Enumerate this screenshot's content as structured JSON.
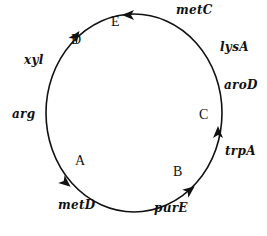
{
  "diagram": {
    "type": "circular-chromosome-map",
    "circle": {
      "cx": 134,
      "cy": 113,
      "rx": 88,
      "ry": 99,
      "stroke": "#111111"
    },
    "genes": [
      {
        "id": "metC",
        "label": "metC",
        "x": 176,
        "y": 13
      },
      {
        "id": "lysA",
        "label": "lysA",
        "x": 220,
        "y": 50
      },
      {
        "id": "aroD",
        "label": "aroD",
        "x": 224,
        "y": 88
      },
      {
        "id": "trpA",
        "label": "trpA",
        "x": 225,
        "y": 154
      },
      {
        "id": "purE",
        "label": "purE",
        "x": 154,
        "y": 211
      },
      {
        "id": "metD",
        "label": "metD",
        "x": 58,
        "y": 208
      },
      {
        "id": "arg",
        "label": "arg",
        "x": 12,
        "y": 117
      },
      {
        "id": "xyl",
        "label": "xyl",
        "x": 24,
        "y": 63
      }
    ],
    "origins": [
      {
        "id": "A",
        "label": "A",
        "x": 80,
        "y": 165
      },
      {
        "id": "B",
        "label": "B",
        "x": 178,
        "y": 176
      },
      {
        "id": "C",
        "label": "C",
        "x": 204,
        "y": 119
      },
      {
        "id": "D",
        "label": "D",
        "x": 76,
        "y": 44
      },
      {
        "id": "E",
        "label": "E",
        "x": 116,
        "y": 26
      }
    ],
    "arrows": [
      {
        "id": "arrow-A",
        "x": 66,
        "y": 183,
        "angle": 40
      },
      {
        "id": "arrow-B",
        "x": 190,
        "y": 190,
        "angle": -38
      },
      {
        "id": "arrow-C",
        "x": 218,
        "y": 132,
        "angle": -90
      },
      {
        "id": "arrow-D",
        "x": 76,
        "y": 36,
        "angle": -55
      },
      {
        "id": "arrow-E",
        "x": 128,
        "y": 15,
        "angle": 180
      }
    ]
  }
}
